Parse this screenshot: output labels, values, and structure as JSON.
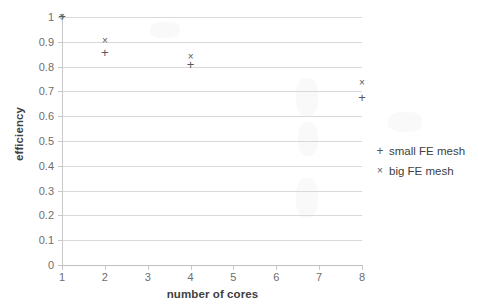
{
  "chart_data": {
    "type": "scatter",
    "title": "",
    "xlabel": "number of cores",
    "ylabel": "efficiency",
    "xlim": [
      1,
      8
    ],
    "ylim": [
      0,
      1
    ],
    "grid": "horizontal",
    "legend_position": "right",
    "x_ticks": [
      "1",
      "2",
      "3",
      "4",
      "5",
      "6",
      "7",
      "8"
    ],
    "y_ticks": [
      "0",
      "0.1",
      "0.2",
      "0.3",
      "0.4",
      "0.5",
      "0.6",
      "0.7",
      "0.8",
      "0.9",
      "1"
    ],
    "series": [
      {
        "name": "small FE mesh",
        "marker": "plus",
        "color": "#595959",
        "points": [
          {
            "x": 1,
            "y": 1.0
          },
          {
            "x": 2,
            "y": 0.855
          },
          {
            "x": 4,
            "y": 0.805
          },
          {
            "x": 8,
            "y": 0.675
          }
        ]
      },
      {
        "name": "big FE mesh",
        "marker": "cross",
        "color": "#595959",
        "points": [
          {
            "x": 1,
            "y": 1.0
          },
          {
            "x": 2,
            "y": 0.903
          },
          {
            "x": 4,
            "y": 0.84
          },
          {
            "x": 8,
            "y": 0.735
          }
        ]
      }
    ],
    "marker_glyphs": {
      "plus": "+",
      "cross": "×"
    }
  },
  "legend": {
    "entries": [
      {
        "marker": "+",
        "label": "small FE mesh"
      },
      {
        "marker": "×",
        "label": "big FE mesh"
      }
    ]
  },
  "colors": {
    "gridline": "#d9d9d9",
    "axis": "#c8c8c8",
    "tick_text": "#6e6e6e",
    "title_text": "#404040",
    "marker": "#595959",
    "background": "#ffffff"
  }
}
